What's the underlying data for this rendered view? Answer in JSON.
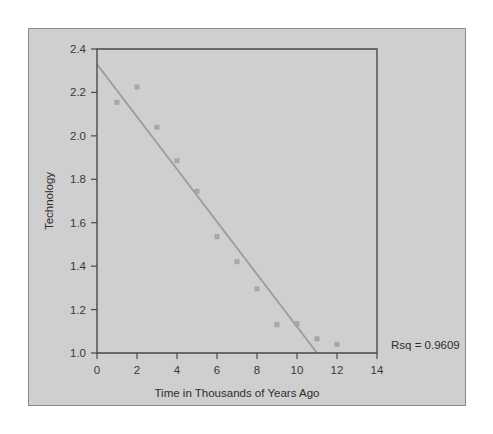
{
  "chart_data": {
    "type": "scatter",
    "title": "",
    "xlabel": "Time in Thousands of Years Ago",
    "ylabel": "Technology",
    "xlim": [
      0,
      14
    ],
    "ylim": [
      1.0,
      2.4
    ],
    "xticks": [
      "0",
      "2",
      "4",
      "6",
      "8",
      "10",
      "12",
      "14"
    ],
    "xtick_values": [
      0,
      2,
      4,
      6,
      8,
      10,
      12,
      14
    ],
    "yticks": [
      "1.0",
      "1.2",
      "1.4",
      "1.6",
      "1.8",
      "2.0",
      "2.2",
      "2.4"
    ],
    "ytick_values": [
      1.0,
      1.2,
      1.4,
      1.6,
      1.8,
      2.0,
      2.2,
      2.4
    ],
    "grid": false,
    "legend": "none",
    "series": [
      {
        "name": "Technology observations",
        "marker": "square",
        "color": "#a8a8a8",
        "x": [
          1,
          2,
          3,
          4,
          5,
          6,
          7,
          8,
          9,
          10,
          11,
          12
        ],
        "y": [
          2.155,
          2.225,
          2.04,
          1.885,
          1.745,
          1.535,
          1.42,
          1.295,
          1.13,
          1.135,
          1.065,
          1.04
        ]
      }
    ],
    "fit_line": {
      "name": "linear regression fit",
      "color": "#9b9b9b",
      "x": [
        0,
        11
      ],
      "y": [
        2.33,
        1.0
      ]
    },
    "annotations": [
      {
        "name": "rsq-annotation",
        "text": "Rsq = 0.9609",
        "x": 14.6,
        "y": 1.02
      }
    ]
  },
  "colors": {
    "page_background": "#ffffff",
    "panel_background": "#cfcfcf",
    "panel_border": "#8a8a8a",
    "axis": "#4a4a4a",
    "marker": "#a8a8a8",
    "fit_line": "#9b9b9b",
    "text": "#2e2e2e"
  }
}
